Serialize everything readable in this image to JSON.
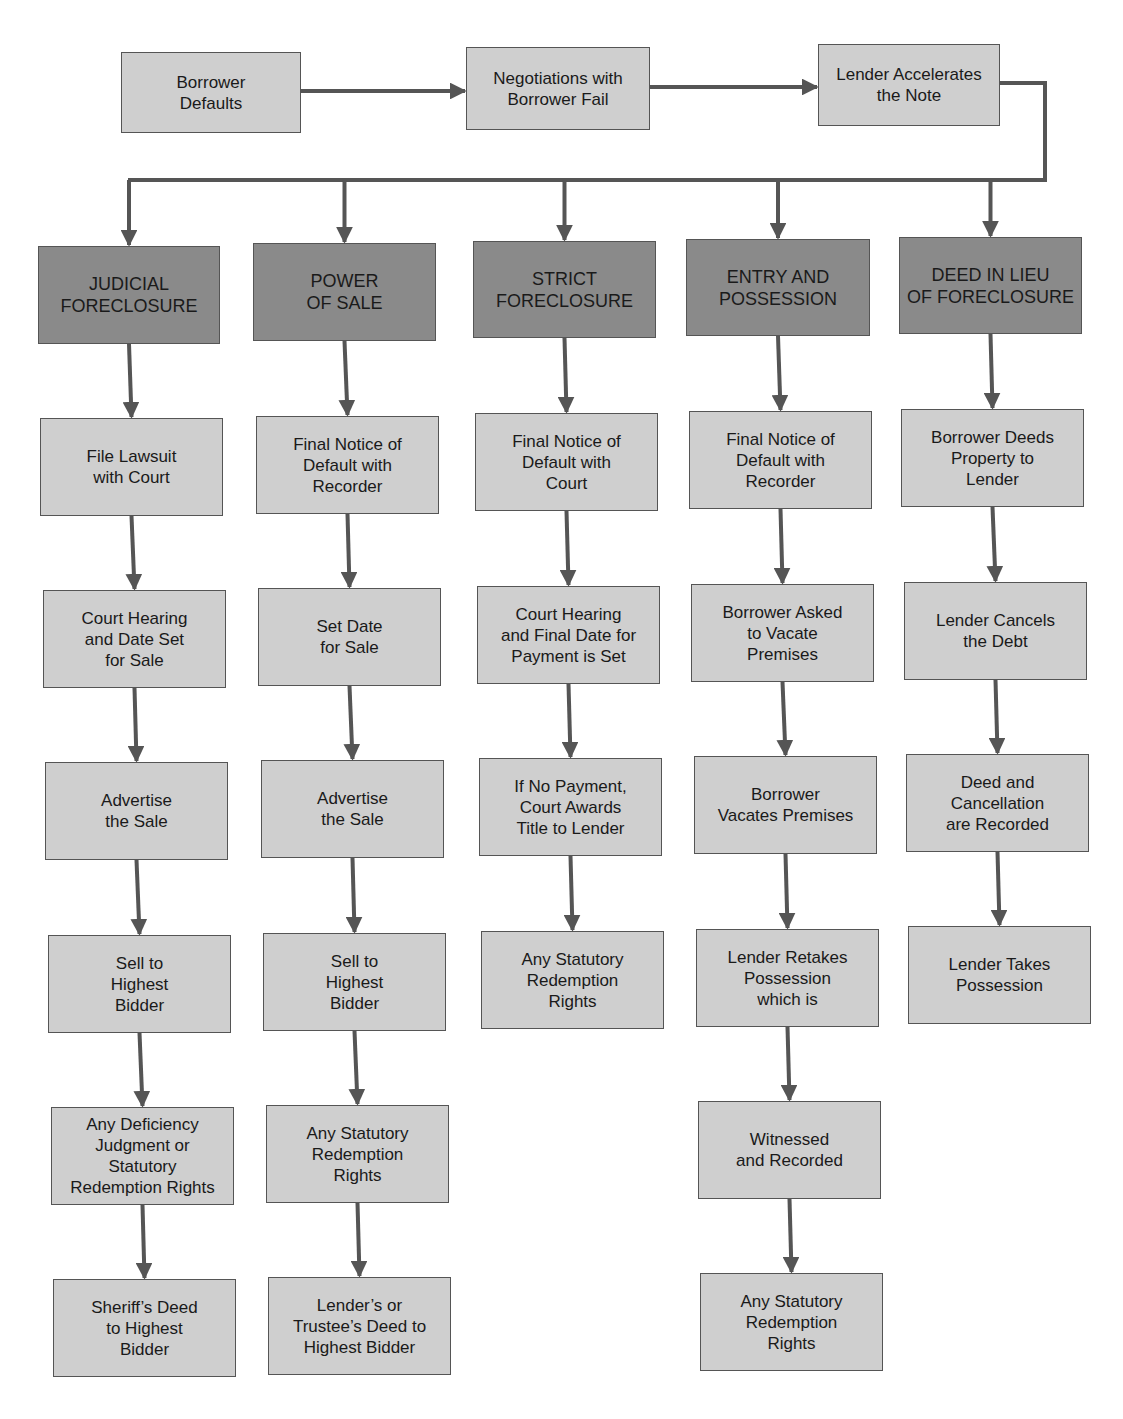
{
  "diagram": {
    "colors": {
      "step_fill": "#cfcfcf",
      "header_fill": "#8a8a8a",
      "line": "#555555",
      "text": "#1a1a1a"
    },
    "top_flow": [
      {
        "id": "borrower-defaults",
        "label": "Borrower\nDefaults",
        "x": 121,
        "y": 52,
        "w": 180,
        "h": 81
      },
      {
        "id": "negotiations-fail",
        "label": "Negotiations with\nBorrower Fail",
        "x": 466,
        "y": 47,
        "w": 184,
        "h": 83
      },
      {
        "id": "lender-accelerates",
        "label": "Lender Accelerates\nthe Note",
        "x": 818,
        "y": 44,
        "w": 182,
        "h": 82
      }
    ],
    "columns": [
      {
        "id": "judicial-foreclosure",
        "header": {
          "label": "JUDICIAL\nFORECLOSURE",
          "x": 38,
          "y": 246,
          "w": 182,
          "h": 98
        },
        "steps": [
          {
            "label": "File Lawsuit\nwith Court",
            "x": 40,
            "y": 418,
            "w": 183,
            "h": 98
          },
          {
            "label": "Court Hearing\nand Date Set\nfor Sale",
            "x": 43,
            "y": 590,
            "w": 183,
            "h": 98
          },
          {
            "label": "Advertise\nthe Sale",
            "x": 45,
            "y": 762,
            "w": 183,
            "h": 98
          },
          {
            "label": "Sell to\nHighest\nBidder",
            "x": 48,
            "y": 935,
            "w": 183,
            "h": 98
          },
          {
            "label": "Any Deficiency\nJudgment or\nStatutory\nRedemption Rights",
            "x": 51,
            "y": 1107,
            "w": 183,
            "h": 98
          },
          {
            "label": "Sheriff’s Deed\nto Highest\nBidder",
            "x": 53,
            "y": 1279,
            "w": 183,
            "h": 98
          }
        ]
      },
      {
        "id": "power-of-sale",
        "header": {
          "label": "POWER\nOF SALE",
          "x": 253,
          "y": 243,
          "w": 183,
          "h": 98
        },
        "steps": [
          {
            "label": "Final Notice of\nDefault with\nRecorder",
            "x": 256,
            "y": 416,
            "w": 183,
            "h": 98
          },
          {
            "label": "Set Date\nfor Sale",
            "x": 258,
            "y": 588,
            "w": 183,
            "h": 98
          },
          {
            "label": "Advertise\nthe Sale",
            "x": 261,
            "y": 760,
            "w": 183,
            "h": 98
          },
          {
            "label": "Sell to\nHighest\nBidder",
            "x": 263,
            "y": 933,
            "w": 183,
            "h": 98
          },
          {
            "label": "Any Statutory\nRedemption\nRights",
            "x": 266,
            "y": 1105,
            "w": 183,
            "h": 98
          },
          {
            "label": "Lender’s or\nTrustee’s Deed to\nHighest Bidder",
            "x": 268,
            "y": 1277,
            "w": 183,
            "h": 98
          }
        ]
      },
      {
        "id": "strict-foreclosure",
        "header": {
          "label": "STRICT\nFORECLOSURE",
          "x": 473,
          "y": 241,
          "w": 183,
          "h": 97
        },
        "steps": [
          {
            "label": "Final Notice of\nDefault with\nCourt",
            "x": 475,
            "y": 413,
            "w": 183,
            "h": 98
          },
          {
            "label": "Court Hearing\nand Final Date for\nPayment is Set",
            "x": 477,
            "y": 586,
            "w": 183,
            "h": 98
          },
          {
            "label": "If No Payment,\nCourt Awards\nTitle to Lender",
            "x": 479,
            "y": 758,
            "w": 183,
            "h": 98
          },
          {
            "label": "Any Statutory\nRedemption\nRights",
            "x": 481,
            "y": 931,
            "w": 183,
            "h": 98
          }
        ]
      },
      {
        "id": "entry-and-possession",
        "header": {
          "label": "ENTRY AND\nPOSSESSION",
          "x": 686,
          "y": 239,
          "w": 184,
          "h": 97
        },
        "steps": [
          {
            "label": "Final Notice of\nDefault with\nRecorder",
            "x": 689,
            "y": 411,
            "w": 183,
            "h": 98
          },
          {
            "label": "Borrower Asked\nto Vacate\nPremises",
            "x": 691,
            "y": 584,
            "w": 183,
            "h": 98
          },
          {
            "label": "Borrower\nVacates Premises",
            "x": 694,
            "y": 756,
            "w": 183,
            "h": 98
          },
          {
            "label": "Lender Retakes\nPossession\nwhich is",
            "x": 696,
            "y": 929,
            "w": 183,
            "h": 98
          },
          {
            "label": "Witnessed\nand Recorded",
            "x": 698,
            "y": 1101,
            "w": 183,
            "h": 98
          },
          {
            "label": "Any Statutory\nRedemption\nRights",
            "x": 700,
            "y": 1273,
            "w": 183,
            "h": 98
          }
        ]
      },
      {
        "id": "deed-in-lieu",
        "header": {
          "label": "DEED IN LIEU\nOF FORECLOSURE",
          "x": 899,
          "y": 237,
          "w": 183,
          "h": 97
        },
        "steps": [
          {
            "label": "Borrower Deeds\nProperty to\nLender",
            "x": 901,
            "y": 409,
            "w": 183,
            "h": 98
          },
          {
            "label": "Lender Cancels\nthe Debt",
            "x": 904,
            "y": 582,
            "w": 183,
            "h": 98
          },
          {
            "label": "Deed and\nCancellation\nare Recorded",
            "x": 906,
            "y": 754,
            "w": 183,
            "h": 98
          },
          {
            "label": "Lender Takes\nPossession",
            "x": 908,
            "y": 926,
            "w": 183,
            "h": 98
          }
        ]
      }
    ]
  }
}
